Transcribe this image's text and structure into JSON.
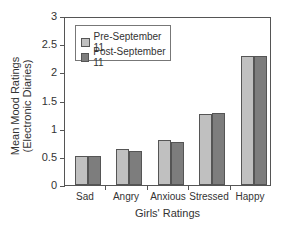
{
  "chart_data": {
    "type": "bar",
    "title": "",
    "xlabel": "Girls' Ratings",
    "ylabel": "Mean Mood Ratings (Electronic Diaries)",
    "ylabel_line1": "Mean Mood Ratings",
    "ylabel_line2": "(Electronic Diaries)",
    "ylim": [
      0,
      3
    ],
    "yticks": [
      "0",
      "0.5",
      "1",
      "1.5",
      "2",
      "2.5",
      "3"
    ],
    "categories": [
      "Sad",
      "Angry",
      "Anxious",
      "Stressed",
      "Happy"
    ],
    "series": [
      {
        "name": "Pre-September 11",
        "color": "#c0c0c0",
        "values": [
          0.52,
          0.64,
          0.79,
          1.26,
          2.29
        ]
      },
      {
        "name": "Post-September 11",
        "color": "#7d7d7d",
        "values": [
          0.52,
          0.6,
          0.77,
          1.28,
          2.29
        ]
      }
    ],
    "legend_position": "upper-left",
    "grid": false
  }
}
